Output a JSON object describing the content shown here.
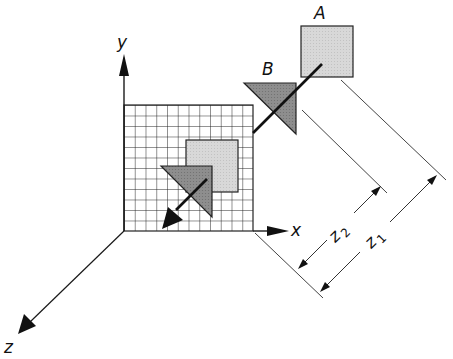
{
  "diagram": {
    "type": "3d-coordinate-projection",
    "axes": {
      "x_label": "x",
      "y_label": "y",
      "z_label": "z"
    },
    "objects": [
      {
        "id": "A",
        "label": "A",
        "shape": "square",
        "fill": "#d4d4d4"
      },
      {
        "id": "B",
        "label": "B",
        "shape": "triangle",
        "fill": "#8a8a8a"
      }
    ],
    "projection_plane": {
      "shape": "grid",
      "columns": 12,
      "rows": 12,
      "projected_square_fill": "#d4d4d4",
      "projected_triangle_fill": "#8a8a8a"
    },
    "dimensions": [
      {
        "id": "z2",
        "base": "z",
        "subscript": "2"
      },
      {
        "id": "z1",
        "base": "z",
        "subscript": "1"
      }
    ],
    "colors": {
      "line": "#1a1a1a",
      "thin_line": "#444444",
      "background": "#ffffff"
    }
  }
}
